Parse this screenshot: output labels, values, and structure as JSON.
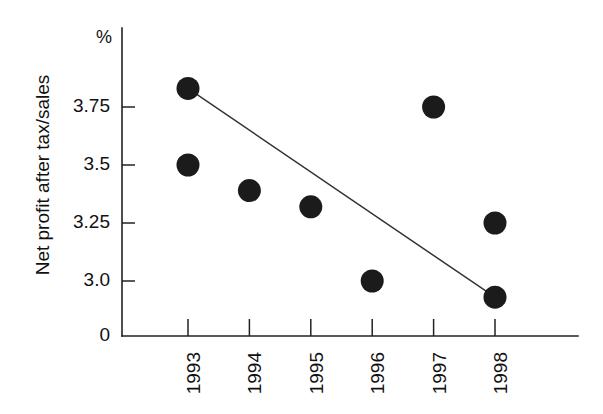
{
  "chart_data": {
    "type": "scatter",
    "title": "",
    "subtitle": "",
    "xlabel": "",
    "ylabel": "Net profit after tax/sales",
    "unit_label": "%",
    "categories": [
      "1993",
      "1994",
      "1995",
      "1996",
      "1997",
      "1998"
    ],
    "x_tick_labels": [
      "1993",
      "1994",
      "1995",
      "1996",
      "1997",
      "1998"
    ],
    "y_tick_labels": [
      "3.75",
      "3.5",
      "3.25",
      "3.0",
      "0"
    ],
    "y_tick_values": [
      3.75,
      3.5,
      3.25,
      3.0,
      0
    ],
    "ylim": [
      2.85,
      3.95
    ],
    "grid": false,
    "legend": null,
    "series": [
      {
        "name": "Net profit after tax/sales",
        "marker": "filled-circle",
        "color": "#1b1b1b",
        "points": [
          {
            "x": "1993",
            "y": 3.83
          },
          {
            "x": "1993",
            "y": 3.5
          },
          {
            "x": "1994",
            "y": 3.39
          },
          {
            "x": "1995",
            "y": 3.32
          },
          {
            "x": "1996",
            "y": 3.0
          },
          {
            "x": "1997",
            "y": 3.75
          },
          {
            "x": "1998",
            "y": 3.25
          },
          {
            "x": "1998",
            "y": 2.93
          }
        ]
      },
      {
        "name": "trend-line",
        "marker": "none",
        "color": "#333333",
        "points": [
          {
            "x": "1993",
            "y": 3.83
          },
          {
            "x": "1998",
            "y": 2.93
          }
        ]
      }
    ]
  },
  "axis": {
    "y_unit": "%",
    "y_title": "Net profit after tax/sales"
  }
}
